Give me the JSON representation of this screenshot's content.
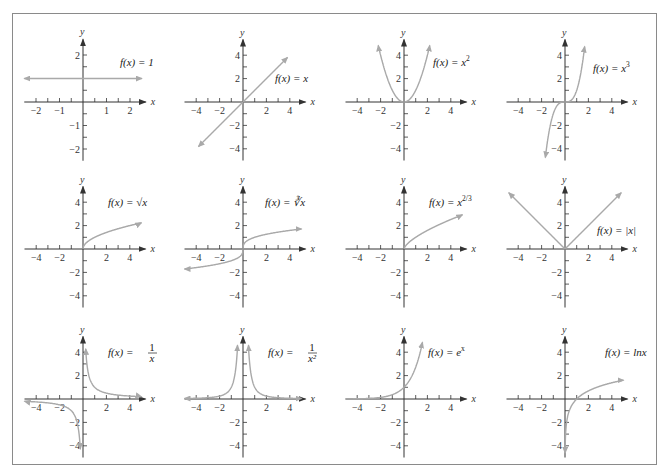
{
  "page": {
    "frame_color": "#8a8a8a",
    "curve_color": "#a9a9a9",
    "axis_color": "#333333"
  },
  "chart_data": [
    {
      "id": "constant",
      "type": "line",
      "title": "f(x) = 1",
      "label_parts": [
        "f(x) = 1"
      ],
      "xlim": [
        -2.5,
        2.5
      ],
      "ylim": [
        -2.5,
        2.5
      ],
      "xticks": [
        -2,
        -1,
        1,
        2
      ],
      "yticks": [
        -2,
        -1,
        2
      ],
      "minor_step": 0.5,
      "xlabel": "x",
      "ylabel": "y",
      "fn": "1",
      "domain": [
        -2.5,
        2.5
      ],
      "arrows": "both"
    },
    {
      "id": "identity",
      "type": "line",
      "title": "f(x) = x",
      "label_parts": [
        "f(x) = x"
      ],
      "xlim": [
        -5,
        5
      ],
      "ylim": [
        -5,
        5
      ],
      "xticks": [
        -4,
        -2,
        2,
        4
      ],
      "yticks": [
        -4,
        -2,
        2,
        4
      ],
      "minor_step": 1,
      "xlabel": "x",
      "ylabel": "y",
      "fn": "x",
      "domain": [
        -3.8,
        3.8
      ],
      "arrows": "both"
    },
    {
      "id": "square",
      "type": "line",
      "title": "f(x) = x^2",
      "label_parts": [
        "f(x) = x",
        "2"
      ],
      "xlim": [
        -5,
        5
      ],
      "ylim": [
        -5,
        5
      ],
      "xticks": [
        -4,
        -2,
        2,
        4
      ],
      "yticks": [
        -4,
        -2,
        2,
        4
      ],
      "minor_step": 1,
      "xlabel": "x",
      "ylabel": "y",
      "fn": "x*x",
      "domain": [
        -2.2,
        2.2
      ],
      "arrows": "both"
    },
    {
      "id": "cube",
      "type": "line",
      "title": "f(x) = x^3",
      "label_parts": [
        "f(x) = x",
        "3"
      ],
      "xlim": [
        -5,
        5
      ],
      "ylim": [
        -5,
        5
      ],
      "xticks": [
        -4,
        -2,
        2,
        4
      ],
      "yticks": [
        -4,
        -2,
        2,
        4
      ],
      "minor_step": 1,
      "xlabel": "x",
      "ylabel": "y",
      "fn": "x*x*x",
      "domain": [
        -1.68,
        1.68
      ],
      "arrows": "both"
    },
    {
      "id": "sqrt",
      "type": "line",
      "title": "f(x) = √x",
      "label_parts": [
        "f(x) = √x"
      ],
      "xlim": [
        -5,
        5
      ],
      "ylim": [
        -5,
        5
      ],
      "xticks": [
        -4,
        -2,
        2,
        4
      ],
      "yticks": [
        -4,
        -2,
        2,
        4
      ],
      "minor_step": 1,
      "xlabel": "x",
      "ylabel": "y",
      "fn": "Math.sqrt(x)",
      "domain": [
        0,
        5
      ],
      "arrows": "end"
    },
    {
      "id": "cbrt",
      "type": "line",
      "title": "f(x) = ∛x",
      "label_parts": [
        "f(x) = ∛x"
      ],
      "xlim": [
        -5,
        5
      ],
      "ylim": [
        -5,
        5
      ],
      "xticks": [
        -4,
        -2,
        2,
        4
      ],
      "yticks": [
        -4,
        -2,
        2,
        4
      ],
      "minor_step": 1,
      "xlabel": "x",
      "ylabel": "y",
      "fn": "Math.cbrt(x)",
      "domain": [
        -5,
        5
      ],
      "arrows": "both"
    },
    {
      "id": "two-thirds",
      "type": "line",
      "title": "f(x) = x^(2/3)",
      "label_parts": [
        "f(x) = x",
        "2/3"
      ],
      "xlim": [
        -5,
        5
      ],
      "ylim": [
        -5,
        5
      ],
      "xticks": [
        -4,
        -2,
        2,
        4
      ],
      "yticks": [
        -4,
        -2,
        2,
        4
      ],
      "minor_step": 1,
      "xlabel": "x",
      "ylabel": "y",
      "fn": "Math.pow(x,2/3)",
      "domain": [
        0,
        5
      ],
      "arrows": "end"
    },
    {
      "id": "abs",
      "type": "line",
      "title": "f(x) = |x|",
      "label_parts": [
        "f(x) = |x|"
      ],
      "xlim": [
        -5,
        5
      ],
      "ylim": [
        -5,
        5
      ],
      "xticks": [
        -4,
        -2,
        2,
        4
      ],
      "yticks": [
        -4,
        -2,
        2,
        4
      ],
      "minor_step": 1,
      "xlabel": "x",
      "ylabel": "y",
      "fn": "Math.abs(x)",
      "domain": [
        -4.8,
        4.8
      ],
      "arrows": "both"
    },
    {
      "id": "reciprocal",
      "type": "line",
      "title": "f(x) = 1/x",
      "label_parts": [
        "f(x) = ",
        "1",
        "x"
      ],
      "xlim": [
        -5,
        5
      ],
      "ylim": [
        -5,
        5
      ],
      "xticks": [
        -4,
        -2,
        2,
        4
      ],
      "yticks": [
        -4,
        -2,
        2,
        4
      ],
      "minor_step": 1,
      "xlabel": "x",
      "ylabel": "y",
      "fn": "1/x",
      "domain": [
        -5,
        5
      ],
      "asymptote": 0,
      "arrows": "both"
    },
    {
      "id": "inverse-square",
      "type": "line",
      "title": "f(x) = 1/x^2",
      "label_parts": [
        "f(x) = ",
        "1",
        "x²"
      ],
      "xlim": [
        -5,
        5
      ],
      "ylim": [
        -5,
        5
      ],
      "xticks": [
        -4,
        -2,
        2,
        4
      ],
      "yticks": [
        -2,
        -4
      ],
      "minor_step": 1,
      "xlabel": "x",
      "ylabel": "y",
      "fn": "1/(x*x)",
      "domain": [
        -5,
        5
      ],
      "asymptote": 0,
      "arrows": "both"
    },
    {
      "id": "exp",
      "type": "line",
      "title": "f(x) = e^x",
      "label_parts": [
        "f(x) = e",
        "x"
      ],
      "xlim": [
        -5,
        5
      ],
      "ylim": [
        -5,
        5
      ],
      "xticks": [
        -4,
        -2,
        2,
        4
      ],
      "yticks": [
        -4,
        -2,
        2,
        4
      ],
      "minor_step": 1,
      "xlabel": "x",
      "ylabel": "y",
      "fn": "Math.exp(x)",
      "domain": [
        -5,
        1.6
      ],
      "arrows": "end"
    },
    {
      "id": "ln",
      "type": "line",
      "title": "f(x) = ln x",
      "label_parts": [
        "f(x) = lnx"
      ],
      "xlim": [
        -5,
        5
      ],
      "ylim": [
        -5,
        5
      ],
      "xticks": [
        -4,
        -2,
        2,
        4
      ],
      "yticks": [
        -4,
        -2,
        2,
        4
      ],
      "minor_step": 1,
      "xlabel": "x",
      "ylabel": "y",
      "fn": "Math.log(x)",
      "domain": [
        0.01,
        5
      ],
      "arrows": "both"
    }
  ],
  "layout": {
    "origins": [
      [
        83,
        102
      ],
      [
        243,
        102
      ],
      [
        404,
        102
      ],
      [
        565,
        102
      ],
      [
        83,
        249
      ],
      [
        243,
        249
      ],
      [
        404,
        249
      ],
      [
        565,
        249
      ],
      [
        83,
        399
      ],
      [
        243,
        399
      ],
      [
        404,
        399
      ],
      [
        565,
        399
      ]
    ],
    "unit_px": [
      23.5,
      11.7,
      11.7,
      11.7,
      11.7,
      11.7,
      11.7,
      11.7,
      11.7,
      11.7,
      11.7,
      11.7
    ],
    "label_pos": [
      [
        120,
        66
      ],
      [
        275,
        82
      ],
      [
        433,
        66
      ],
      [
        593,
        72
      ],
      [
        108,
        206
      ],
      [
        265,
        206
      ],
      [
        429,
        206
      ],
      [
        597,
        234
      ],
      [
        108,
        356
      ],
      [
        268,
        356
      ],
      [
        428,
        356
      ],
      [
        605,
        356
      ]
    ]
  }
}
